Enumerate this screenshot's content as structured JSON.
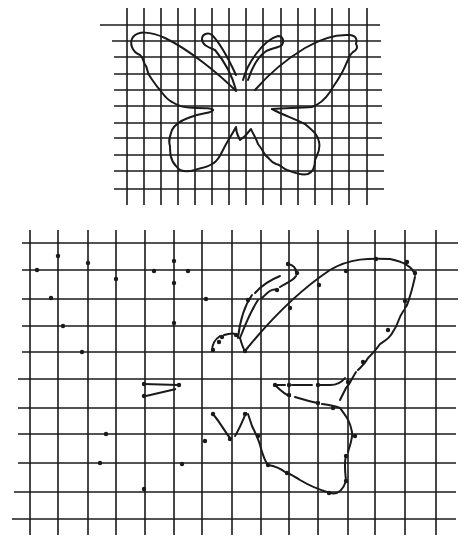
{
  "colors": {
    "ink": "#1a1a1a",
    "background": "#ffffff"
  },
  "small_grid": {
    "description": "Original butterfly outline on a small square grid",
    "columns": 15,
    "rows": 11,
    "cell_px": 16.5
  },
  "large_grid": {
    "description": "Enlarged grid with partially transferred butterfly outline (right wing) and reference dots",
    "columns": 15,
    "rows": 11,
    "cell_px": 28.7
  }
}
